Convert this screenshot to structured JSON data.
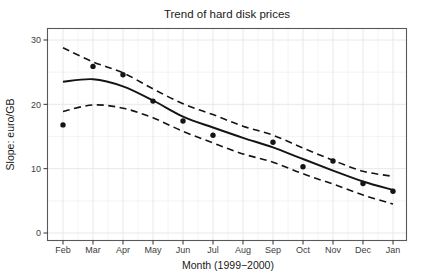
{
  "chart_data": {
    "type": "scatter",
    "title": "Trend of hard disk prices",
    "xlabel": "Month (1999−2000)",
    "ylabel": "Slope: euro/GB",
    "categories": [
      "Feb",
      "Mar",
      "Apr",
      "May",
      "Jun",
      "Jul",
      "Aug",
      "Sep",
      "Oct",
      "Nov",
      "Dec",
      "Jan"
    ],
    "yticks": [
      0,
      10,
      20,
      30
    ],
    "ylim": [
      -1.2,
      31.8
    ],
    "grid": true,
    "legend": "none",
    "series": [
      {
        "name": "observed-points",
        "kind": "scatter",
        "values": [
          16.8,
          25.9,
          24.6,
          20.5,
          17.4,
          15.2,
          null,
          14.1,
          10.3,
          11.2,
          7.7,
          6.5
        ]
      },
      {
        "name": "smooth-fit",
        "kind": "line",
        "style": "solid",
        "values": [
          23.5,
          23.9,
          22.8,
          20.6,
          18.1,
          16.4,
          14.8,
          13.3,
          11.5,
          9.7,
          8.0,
          6.7
        ]
      },
      {
        "name": "upper-confidence",
        "kind": "line",
        "style": "dashed",
        "values": [
          28.8,
          26.6,
          24.9,
          22.4,
          20.1,
          18.4,
          16.6,
          15.2,
          13.2,
          11.3,
          9.6,
          8.8
        ]
      },
      {
        "name": "lower-confidence",
        "kind": "line",
        "style": "dashed",
        "values": [
          18.9,
          19.9,
          19.4,
          17.9,
          15.8,
          14.0,
          12.3,
          11.0,
          9.2,
          7.6,
          5.9,
          4.5
        ]
      }
    ],
    "colors": {
      "line": "#141414",
      "point": "#141414",
      "grid_major": "#e8e8e8",
      "grid_minor": "#f3f3f3",
      "panel_border": "#595959",
      "tick": "#333333",
      "tick_text": "#3d3d3d",
      "title_text": "#1a1a1a"
    }
  }
}
